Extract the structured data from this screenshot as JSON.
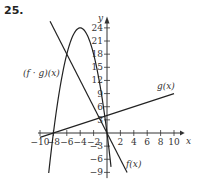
{
  "problem_number": "25.",
  "chart_data": {
    "type": "line",
    "title": "",
    "xlabel": "x",
    "ylabel": "y",
    "xlim": [
      -10,
      10
    ],
    "ylim": [
      -9,
      24
    ],
    "x_ticks": [
      -10,
      -8,
      -6,
      -4,
      -2,
      2,
      4,
      6,
      8,
      10
    ],
    "x_tick_labels": [
      "−10",
      "−8",
      "−6",
      "−4",
      "−2",
      "2",
      "4",
      "6",
      "8",
      "10"
    ],
    "y_ticks": [
      24,
      21,
      18,
      15,
      12,
      9,
      6,
      3,
      -3,
      -6,
      -9
    ],
    "y_tick_labels": [
      "24",
      "21",
      "18",
      "15",
      "12",
      "9",
      "6",
      "3",
      "−3",
      "−6",
      "−9"
    ],
    "grid": false,
    "series": [
      {
        "name": "f(x)",
        "label": "f(x)",
        "formula": "-3x",
        "x": [
          -8.5,
          0,
          3
        ],
        "y": [
          25.5,
          0,
          -9
        ]
      },
      {
        "name": "g(x)",
        "label": "g(x)",
        "formula": "x/2 + 4",
        "x": [
          -10,
          -8,
          0,
          10
        ],
        "y": [
          -1,
          0,
          4,
          9
        ]
      },
      {
        "name": "(f·g)(x)",
        "label": "(f · g)(x)",
        "formula": "-1.5x^2 - 12x",
        "x": [
          -8.7,
          -8,
          -6,
          -4,
          -2,
          0,
          0.6
        ],
        "y": [
          -9,
          0,
          18,
          24,
          18,
          0,
          -7.7
        ]
      }
    ]
  }
}
